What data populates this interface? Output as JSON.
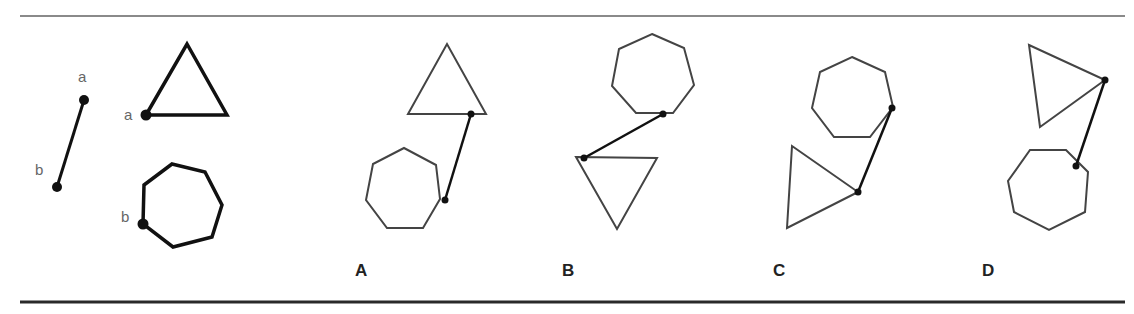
{
  "figure": {
    "question_number_partial": "2.",
    "rules": {
      "top": {
        "y": 16,
        "x1": 20,
        "x2": 1125,
        "color": "#8a8a8a",
        "width": 2
      },
      "bottom": {
        "y": 302,
        "x1": 20,
        "x2": 1125,
        "color": "#2a2a2a",
        "width": 3
      }
    },
    "reference": {
      "segment": {
        "a_label": "a",
        "b_label": "b",
        "a": [
          84,
          100
        ],
        "b": [
          57,
          187
        ]
      },
      "triangle": {
        "vertex_label": "a",
        "points": [
          [
            146,
            115
          ],
          [
            187,
            44
          ],
          [
            227,
            115
          ]
        ],
        "marked_vertex": [
          146,
          115
        ]
      },
      "heptagon": {
        "vertex_label": "b",
        "points": [
          [
            172,
            164
          ],
          [
            205,
            172
          ],
          [
            222,
            205
          ],
          [
            212,
            237
          ],
          [
            173,
            247
          ],
          [
            143,
            224
          ],
          [
            144,
            185
          ]
        ],
        "marked_vertex": [
          143,
          224
        ]
      }
    },
    "options": [
      {
        "label": "A",
        "label_pos": [
          355,
          276
        ],
        "triangle": [
          [
            408,
            114
          ],
          [
            447,
            44
          ],
          [
            486,
            114
          ]
        ],
        "heptagon": [
          [
            404,
            148
          ],
          [
            436,
            165
          ],
          [
            440,
            199
          ],
          [
            423,
            228
          ],
          [
            387,
            228
          ],
          [
            366,
            200
          ],
          [
            373,
            164
          ]
        ],
        "link": [
          [
            471,
            114
          ],
          [
            445,
            200
          ]
        ]
      },
      {
        "label": "B",
        "label_pos": [
          562,
          276
        ],
        "heptagon": [
          [
            652,
            34
          ],
          [
            684,
            48
          ],
          [
            694,
            85
          ],
          [
            673,
            113
          ],
          [
            636,
            113
          ],
          [
            612,
            86
          ],
          [
            619,
            49
          ]
        ],
        "triangle": [
          [
            576,
            157
          ],
          [
            657,
            158
          ],
          [
            617,
            229
          ]
        ],
        "link": [
          [
            663,
            114
          ],
          [
            584,
            158
          ]
        ]
      },
      {
        "label": "C",
        "label_pos": [
          773,
          276
        ],
        "heptagon": [
          [
            852,
            57
          ],
          [
            885,
            72
          ],
          [
            893,
            107
          ],
          [
            870,
            137
          ],
          [
            834,
            137
          ],
          [
            812,
            108
          ],
          [
            820,
            72
          ]
        ],
        "triangle": [
          [
            792,
            146
          ],
          [
            858,
            192
          ],
          [
            787,
            228
          ]
        ],
        "link": [
          [
            892,
            108
          ],
          [
            858,
            192
          ]
        ]
      },
      {
        "label": "D",
        "label_pos": [
          982,
          276
        ],
        "triangle": [
          [
            1029,
            45
          ],
          [
            1105,
            80
          ],
          [
            1040,
            127
          ]
        ],
        "heptagon": [
          [
            1030,
            150
          ],
          [
            1066,
            150
          ],
          [
            1088,
            172
          ],
          [
            1085,
            212
          ],
          [
            1049,
            230
          ],
          [
            1014,
            212
          ],
          [
            1008,
            181
          ]
        ],
        "link": [
          [
            1105,
            80
          ],
          [
            1076,
            166
          ]
        ]
      }
    ]
  }
}
